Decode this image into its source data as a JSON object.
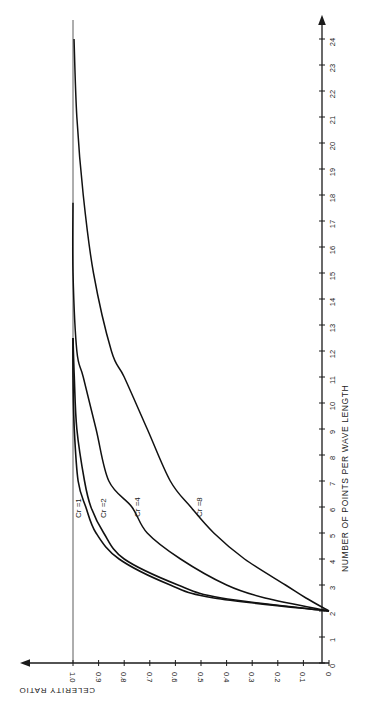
{
  "chart_data": {
    "type": "line",
    "orientation": "rotated 90 degrees (page printed sideways)",
    "title": "",
    "xlabel": "NUMBER OF POINTS PER WAVE LENGTH",
    "ylabel": "CELERITY RATIO",
    "xlim": [
      0,
      24
    ],
    "ylim": [
      0,
      1.0
    ],
    "x_ticks": [
      "0",
      "1",
      "2",
      "3",
      "4",
      "5",
      "6",
      "7",
      "8",
      "9",
      "10",
      "11",
      "12",
      "13",
      "14",
      "15",
      "16",
      "17",
      "18",
      "19",
      "20",
      "21",
      "22",
      "23",
      "24"
    ],
    "y_ticks": [
      "0",
      "0.1",
      "0.2",
      "0.3",
      "0.4",
      "0.5",
      "0.6",
      "0.7",
      "0.8",
      "0.9",
      "1.0"
    ],
    "grid": false,
    "reference_line": {
      "y": 1.0,
      "style": "thin solid"
    },
    "series": [
      {
        "name": "Cr = 1",
        "x": [
          2,
          2.5,
          3,
          4,
          5,
          6,
          7,
          9,
          11,
          12.5
        ],
        "values": [
          0,
          0.45,
          0.62,
          0.82,
          0.91,
          0.95,
          0.98,
          0.995,
          1.0,
          1.0
        ]
      },
      {
        "name": "Cr = 2",
        "x": [
          2,
          2.5,
          3,
          4,
          5,
          6,
          7,
          9,
          11,
          12.5
        ],
        "values": [
          0,
          0.42,
          0.59,
          0.8,
          0.88,
          0.93,
          0.955,
          0.985,
          0.995,
          1.0
        ]
      },
      {
        "name": "Cr = 4",
        "x": [
          2,
          2.5,
          3,
          4,
          5,
          6,
          7,
          9,
          11,
          12,
          15,
          17.7
        ],
        "values": [
          0,
          0.25,
          0.4,
          0.58,
          0.71,
          0.77,
          0.86,
          0.91,
          0.96,
          0.985,
          1.0,
          1.0
        ]
      },
      {
        "name": "Cr = 8",
        "x": [
          2,
          2.5,
          3,
          4,
          5,
          6,
          7,
          9,
          11,
          12,
          15,
          18,
          21,
          24
        ],
        "values": [
          0,
          0.09,
          0.17,
          0.33,
          0.45,
          0.54,
          0.62,
          0.71,
          0.8,
          0.85,
          0.92,
          0.96,
          0.985,
          0.996
        ]
      }
    ],
    "annotations": [
      "Cr =1",
      "Cr =2",
      "Cr =4",
      "Cr =8"
    ],
    "legend": "inline labels on curves"
  },
  "labels": {
    "x_axis_title": "NUMBER OF POINTS PER WAVE LENGTH",
    "y_axis_title": "CELERITY RATIO",
    "curve_labels": [
      "Cr =1",
      "Cr =2",
      "Cr =4",
      "Cr =8"
    ]
  }
}
